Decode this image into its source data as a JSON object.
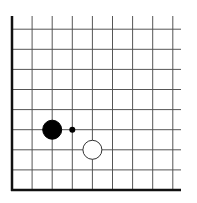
{
  "diagram": {
    "type": "go-board-corner",
    "corner": "bottom-left",
    "grid": {
      "origin_x": 12,
      "origin_y": 190,
      "spacing": 20.1,
      "cols": 9,
      "rows": 9,
      "line_extent_right": 181,
      "line_extent_top": 16,
      "line_color": "#555555",
      "edge_color": "#111111"
    },
    "stones": [
      {
        "color": "black",
        "col": 2,
        "row": 3,
        "fill": "#000000",
        "stroke": "#000000"
      },
      {
        "color": "white",
        "col": 4,
        "row": 2,
        "fill": "#ffffff",
        "stroke": "#333333"
      }
    ],
    "markers": [
      {
        "type": "dot",
        "col": 3,
        "row": 3,
        "fill": "#000000"
      }
    ]
  }
}
